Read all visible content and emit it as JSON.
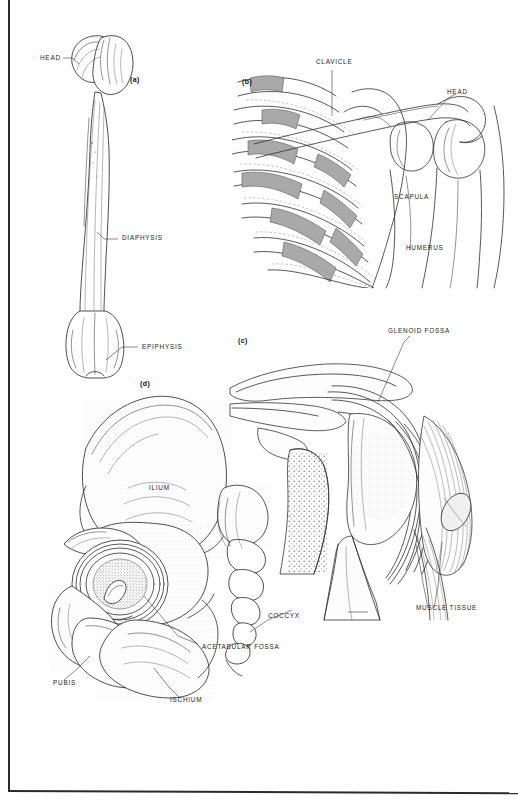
{
  "figure": {
    "kind": "anatomy-plate",
    "background_color": "#ffffff",
    "ink_color": "#2e2e2e",
    "shade_color": "#a9a9a9",
    "border": {
      "left": true,
      "bottom": true,
      "top": false,
      "right": false
    }
  },
  "panels": [
    {
      "id": "a",
      "marker": "(a)",
      "subject": "femur-long-bone",
      "labels": [
        {
          "text": "HEAD",
          "x": 40,
          "y": 58
        },
        {
          "text": "DIAPHYSIS",
          "x": 122,
          "y": 238
        },
        {
          "text": "EPIPHYSIS",
          "x": 142,
          "y": 346
        }
      ]
    },
    {
      "id": "b",
      "marker": "(b)",
      "subject": "shoulder-girdle-ribcage",
      "labels": [
        {
          "text": "CLAVICLE",
          "x": 316,
          "y": 62
        },
        {
          "text": "HEAD",
          "x": 447,
          "y": 92
        },
        {
          "text": "SCAPULA",
          "x": 394,
          "y": 197
        },
        {
          "text": "HUMERUS",
          "x": 406,
          "y": 248
        }
      ]
    },
    {
      "id": "c",
      "marker": "(c)",
      "subject": "shoulder-joint-cross-section",
      "labels": [
        {
          "text": "GLENOID FOSSA",
          "x": 388,
          "y": 331
        },
        {
          "text": "MUSCLE TISSUE",
          "x": 416,
          "y": 608
        }
      ]
    },
    {
      "id": "d",
      "marker": "(d)",
      "subject": "hip-bone-pelvis",
      "labels": [
        {
          "text": "ILIUM",
          "x": 149,
          "y": 488
        },
        {
          "text": "COCCYX",
          "x": 268,
          "y": 616
        },
        {
          "text": "ACETABULAR FOSSA",
          "x": 202,
          "y": 647
        },
        {
          "text": "PUBIS",
          "x": 53,
          "y": 683
        },
        {
          "text": "ISCHIUM",
          "x": 170,
          "y": 700
        }
      ]
    }
  ]
}
